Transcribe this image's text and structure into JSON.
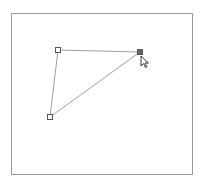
{
  "canvas": {
    "frame": {
      "x": 11,
      "y": 13,
      "width": 182,
      "height": 162,
      "border_color": "#9a9a9a"
    }
  },
  "polygon": {
    "shape": "triangle",
    "stroke_color": "#a0a0a0",
    "vertices": [
      {
        "id": "v1",
        "x": 58,
        "y": 50,
        "selected": false
      },
      {
        "id": "v2",
        "x": 140,
        "y": 52,
        "selected": true
      },
      {
        "id": "v3",
        "x": 50,
        "y": 117,
        "selected": false
      }
    ],
    "handle_size": 5,
    "handle_fill_normal": "#ffffff",
    "handle_fill_selected": "#666666",
    "handle_stroke": "#555555"
  },
  "cursor": {
    "type": "arrow-pointer",
    "x": 141,
    "y": 56
  }
}
